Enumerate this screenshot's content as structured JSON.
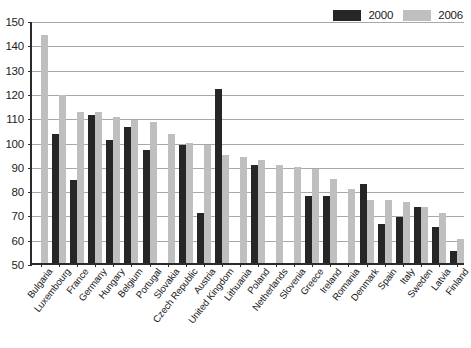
{
  "chart_data": {
    "type": "bar",
    "title": "",
    "xlabel": "",
    "ylabel": "",
    "ylim": [
      50,
      150
    ],
    "ytick_step": 10,
    "yticks": [
      50,
      60,
      70,
      80,
      90,
      100,
      110,
      120,
      130,
      140,
      150
    ],
    "grid": "horizontal",
    "legend_position": "top-right",
    "categories": [
      "Bulgaria",
      "Luxembourg",
      "France",
      "Germany",
      "Hungary",
      "Belgium",
      "Portugal",
      "Slovakia",
      "Czech Republic",
      "Austria",
      "United Kingdom",
      "Lithuania",
      "Poland",
      "Netherlands",
      "Slovenia",
      "Greece",
      "Ireland",
      "Romania",
      "Denmark",
      "Spain",
      "Italy",
      "Sweden",
      "Latvia",
      "Finland"
    ],
    "series": [
      {
        "name": "2000",
        "color": "#262626",
        "values": [
          null,
          103,
          84,
          111,
          100.5,
          106,
          96.5,
          null,
          98.5,
          70.5,
          121.5,
          null,
          90.5,
          null,
          null,
          77.5,
          77.5,
          null,
          82.5,
          66,
          69,
          73,
          65,
          55
        ]
      },
      {
        "name": "2006",
        "color": "#bfbfbf",
        "values": [
          144,
          119,
          112,
          112,
          110,
          109,
          108,
          103,
          99.5,
          98.5,
          94.5,
          93.5,
          92.5,
          90.5,
          89.5,
          88.5,
          84.5,
          80.5,
          76,
          76,
          75,
          73,
          70.5,
          60
        ]
      }
    ]
  },
  "legend": {
    "items": [
      {
        "label": "2000",
        "color": "#262626"
      },
      {
        "label": "2006",
        "color": "#bfbfbf"
      }
    ]
  },
  "axis": {
    "y_tick_labels": [
      "150",
      "140",
      "130",
      "120",
      "110",
      "100",
      "90",
      "80",
      "70",
      "60",
      "50"
    ]
  }
}
